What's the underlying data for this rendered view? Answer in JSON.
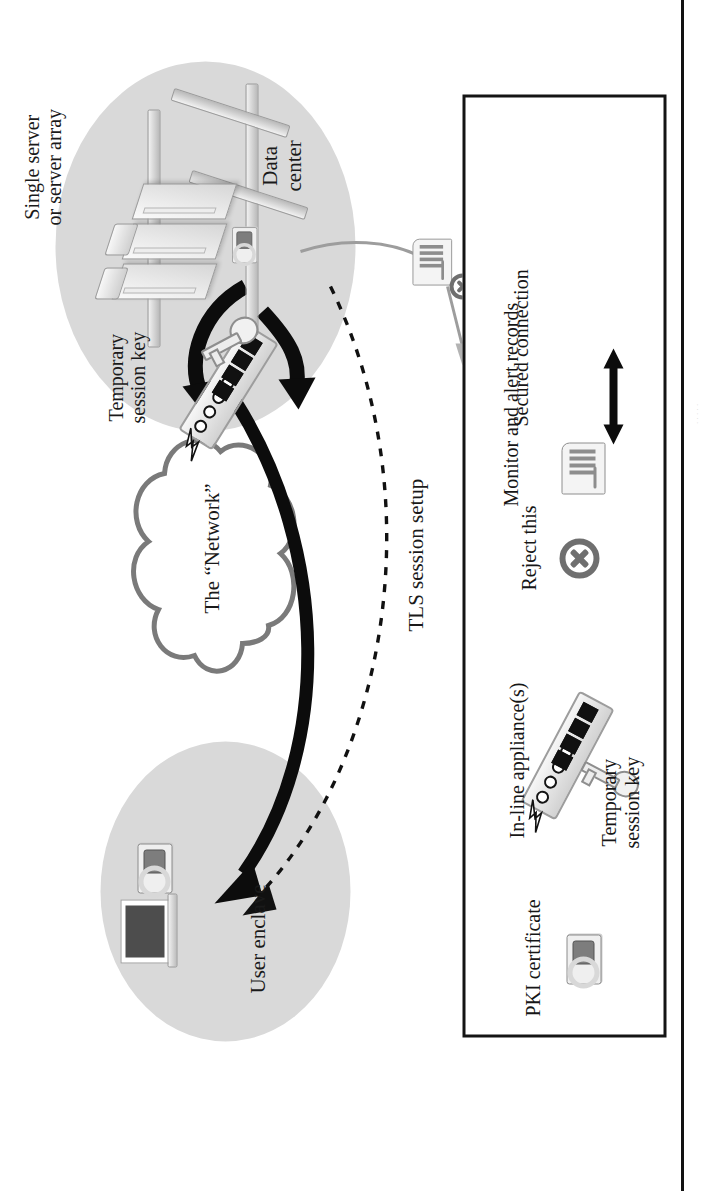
{
  "figure": {
    "zones": [
      {
        "name": "user-enclave",
        "label": "User enclave"
      },
      {
        "name": "data-center",
        "label": "Data\ncenter"
      }
    ],
    "labels": {
      "single_server": "Single server\nor server array",
      "temporary_session_key": "Temporary\nsession key",
      "network_cloud": "The “Network”",
      "tls_session_setup": "TLS session setup",
      "to_security": "To\nsecurity"
    }
  },
  "legend": {
    "items": [
      {
        "icon": "pki-certificate-icon",
        "label": "PKI certificate"
      },
      {
        "icon": "in-line-appliance-icon",
        "label": "In-line appliance(s)"
      },
      {
        "icon": "reject-x-icon",
        "label": "Reject this"
      },
      {
        "icon": "key-icon",
        "label": "Temporary\nsession key"
      },
      {
        "icon": "monitor-records-icon",
        "label": "Monitor and alert records"
      },
      {
        "icon": "double-arrow-icon",
        "label": "Secured connection"
      }
    ]
  },
  "edge": {
    "marginalia": "·   ·   ·   ·   ·"
  },
  "colors": {
    "ink": "#141414",
    "enclave_fill": "#d9d9d9",
    "device_stroke": "#9b9b9b",
    "arrow": "#0c0c0c"
  }
}
